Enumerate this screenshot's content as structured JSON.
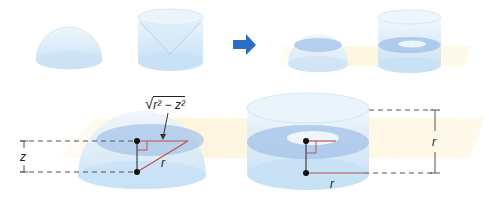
{
  "diagram": {
    "topic": "Cavalieri's principle: hemisphere vs cylinder with cone removed",
    "top_row": {
      "left_solids": [
        "hemisphere",
        "cylinder-minus-cone"
      ],
      "arrow": "right-arrow",
      "right_solids": [
        "hemisphere-sliced",
        "cylinder-minus-cone-sliced"
      ]
    },
    "bottom_left": {
      "solid": "hemisphere",
      "labels": {
        "height": "z",
        "hypotenuse": "r",
        "radius_expression_base": "√",
        "radius_expression": "r² − z²"
      }
    },
    "bottom_right": {
      "solid": "cylinder-minus-cone",
      "labels": {
        "height": "r",
        "radius": "r"
      }
    },
    "colors": {
      "solid_fill": "#cfe6f7",
      "solid_edge": "#a9cdea",
      "cross_section": "#9fbfe8",
      "plane": "#fdf6e1",
      "arrow": "#2a6ec8",
      "segment_red": "#c0504d",
      "dash": "#555555"
    }
  }
}
